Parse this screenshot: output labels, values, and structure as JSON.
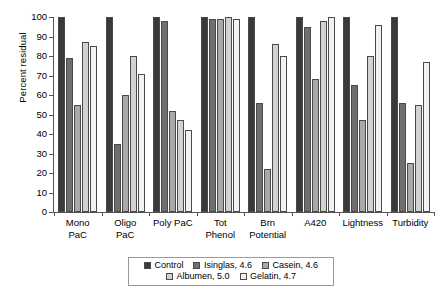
{
  "chart_data": {
    "type": "bar",
    "title": "",
    "xlabel": "",
    "ylabel": "Percent residual",
    "ylim": [
      0,
      100
    ],
    "ytick_step": 10,
    "yticks": [
      100,
      90,
      80,
      70,
      60,
      50,
      40,
      30,
      20,
      10,
      0
    ],
    "grid": false,
    "legend_position": "bottom",
    "categories": [
      "Mono\nPaC",
      "Oligo\nPaC",
      "Poly PaC",
      "Tot\nPhenol",
      "Brn\nPotential",
      "A420",
      "Lightness",
      "Turbidity"
    ],
    "series": [
      {
        "name": "Control",
        "color": "#3a3a3a",
        "values": [
          100,
          100,
          100,
          100,
          100,
          100,
          100,
          100
        ]
      },
      {
        "name": "Isinglas, 4.6",
        "color": "#6e6e6e",
        "values": [
          79,
          35,
          98,
          99,
          56,
          95,
          65,
          56
        ]
      },
      {
        "name": "Casein, 4.6",
        "color": "#a9a9a9",
        "values": [
          55,
          60,
          52,
          99,
          22,
          68,
          47,
          25
        ]
      },
      {
        "name": "Albumen, 5.0",
        "color": "#d2d2d2",
        "values": [
          87,
          80,
          47,
          100,
          86,
          98,
          80,
          55
        ]
      },
      {
        "name": "Gelatin, 4.7",
        "color": "#f2f2f2",
        "values": [
          85,
          71,
          42,
          99,
          80,
          100,
          96,
          77
        ]
      }
    ]
  },
  "axis": {
    "y_title": "Percent residual"
  },
  "legend": {
    "row1": [
      "Control",
      "Isinglas, 4.6",
      "Casein, 4.6"
    ],
    "row2": [
      "Albumen, 5.0",
      "Gelatin, 4.7"
    ]
  }
}
